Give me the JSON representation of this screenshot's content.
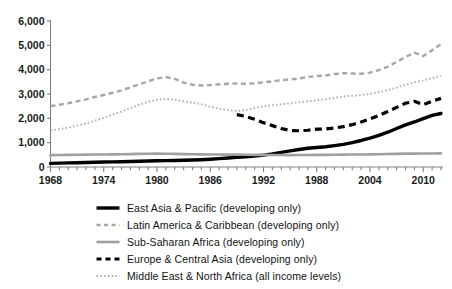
{
  "figure": {
    "title_cropped": "",
    "background_color": "#ffffff"
  },
  "axes": {
    "y_tick_labels": [
      "6,000",
      "5,000",
      "4,000",
      "3,000",
      "2,000",
      "1,000",
      "0"
    ],
    "x_tick_labels": [
      "1968",
      "1974",
      "1980",
      "1986",
      "1992",
      "1988",
      "2004",
      "2010"
    ],
    "axis_color": "#808080"
  },
  "legend": {
    "position": "below-plot",
    "items": [
      {
        "label": "East Asia & Pacific (developing only)",
        "swatch": "solid-thick-black-line-icon",
        "color": "#000000",
        "style": "solid",
        "width": 3.4
      },
      {
        "label": "Latin America & Caribbean (developing only)",
        "swatch": "dashed-gray-line-icon",
        "color": "#a6a6a6",
        "style": "dashed",
        "width": 2.4
      },
      {
        "label": "Sub-Saharan Africa (developing only)",
        "swatch": "solid-gray-line-icon",
        "color": "#a0a0a0",
        "style": "solid",
        "width": 2.6
      },
      {
        "label": "Europe & Central Asia (developing only)",
        "swatch": "dashed-thick-black-line-icon",
        "color": "#000000",
        "style": "dashed",
        "width": 3.2
      },
      {
        "label": "Middle East & North Africa (all income levels)",
        "swatch": "dotted-gray-line-icon",
        "color": "#b3b3b3",
        "style": "dotted",
        "width": 2.0
      }
    ]
  },
  "chart_data": {
    "type": "line",
    "title": "",
    "xlabel": "",
    "ylabel": "",
    "xlim": [
      1968,
      2012
    ],
    "ylim": [
      0,
      6000
    ],
    "ytick_values": [
      0,
      1000,
      2000,
      3000,
      4000,
      5000,
      6000
    ],
    "xtick_values": [
      1968,
      1974,
      1980,
      1986,
      1992,
      1998,
      2004,
      2010
    ],
    "xtick_labels_as_printed": [
      "1968",
      "1974",
      "1980",
      "1986",
      "1992",
      "1988",
      "2004",
      "2010"
    ],
    "minor_xticks_every": 1,
    "grid": false,
    "legend_position": "below",
    "x": [
      1968,
      1969,
      1970,
      1971,
      1972,
      1973,
      1974,
      1975,
      1976,
      1977,
      1978,
      1979,
      1980,
      1981,
      1982,
      1983,
      1984,
      1985,
      1986,
      1987,
      1988,
      1989,
      1990,
      1991,
      1992,
      1993,
      1994,
      1995,
      1996,
      1997,
      1998,
      1999,
      2000,
      2001,
      2002,
      2003,
      2004,
      2005,
      2006,
      2007,
      2008,
      2009,
      2010,
      2011,
      2012
    ],
    "series": [
      {
        "name": "East Asia & Pacific (developing only)",
        "color": "#000000",
        "style": "solid",
        "width": 3.4,
        "values": [
          150,
          160,
          170,
          175,
          185,
          195,
          205,
          210,
          215,
          225,
          235,
          245,
          255,
          260,
          265,
          275,
          285,
          300,
          320,
          345,
          370,
          395,
          420,
          450,
          490,
          540,
          600,
          660,
          720,
          770,
          800,
          830,
          880,
          930,
          1000,
          1090,
          1190,
          1300,
          1430,
          1580,
          1730,
          1850,
          1990,
          2120,
          2200
        ]
      },
      {
        "name": "Latin America & Caribbean (developing only)",
        "color": "#a6a6a6",
        "style": "dashed",
        "width": 2.4,
        "values": [
          2500,
          2560,
          2620,
          2700,
          2780,
          2880,
          2960,
          3050,
          3150,
          3270,
          3400,
          3520,
          3640,
          3700,
          3620,
          3470,
          3380,
          3350,
          3370,
          3400,
          3420,
          3430,
          3420,
          3440,
          3480,
          3520,
          3570,
          3600,
          3640,
          3700,
          3740,
          3760,
          3820,
          3850,
          3840,
          3830,
          3880,
          3980,
          4120,
          4320,
          4520,
          4700,
          4560,
          4800,
          5050
        ]
      },
      {
        "name": "Sub-Saharan Africa (developing only)",
        "color": "#a0a0a0",
        "style": "solid",
        "width": 2.6,
        "values": [
          490,
          495,
          500,
          505,
          508,
          512,
          515,
          518,
          522,
          530,
          540,
          545,
          548,
          545,
          540,
          530,
          522,
          518,
          515,
          512,
          510,
          508,
          505,
          500,
          498,
          495,
          492,
          490,
          492,
          495,
          498,
          500,
          505,
          508,
          512,
          515,
          520,
          525,
          532,
          540,
          548,
          550,
          552,
          556,
          560
        ]
      },
      {
        "name": "Europe & Central Asia (developing only)",
        "color": "#000000",
        "style": "dashed",
        "width": 3.2,
        "values": [
          null,
          null,
          null,
          null,
          null,
          null,
          null,
          null,
          null,
          null,
          null,
          null,
          null,
          null,
          null,
          null,
          null,
          null,
          null,
          null,
          null,
          2150,
          2080,
          1960,
          1820,
          1700,
          1580,
          1500,
          1490,
          1510,
          1560,
          1560,
          1600,
          1660,
          1740,
          1850,
          1980,
          2120,
          2280,
          2450,
          2620,
          2700,
          2560,
          2700,
          2820
        ]
      },
      {
        "name": "Middle East & North Africa (all income levels)",
        "color": "#b3b3b3",
        "style": "dotted",
        "width": 2.0,
        "values": [
          1500,
          1560,
          1620,
          1700,
          1790,
          1900,
          2020,
          2150,
          2280,
          2420,
          2560,
          2680,
          2760,
          2800,
          2760,
          2700,
          2650,
          2580,
          2480,
          2400,
          2340,
          2300,
          2340,
          2420,
          2500,
          2540,
          2580,
          2620,
          2660,
          2700,
          2740,
          2780,
          2840,
          2900,
          2930,
          2960,
          3000,
          3080,
          3160,
          3260,
          3380,
          3480,
          3560,
          3650,
          3750
        ]
      }
    ]
  }
}
